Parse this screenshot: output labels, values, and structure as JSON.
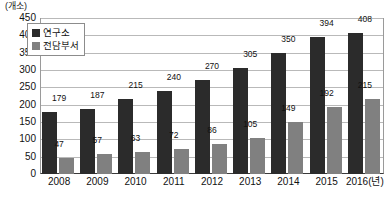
{
  "chart_data": {
    "type": "bar",
    "title": "",
    "subtitle": "",
    "unit_label": "(개소)",
    "xlabel": "",
    "ylabel": "",
    "ylim": [
      0,
      450
    ],
    "ytick_step": 50,
    "grid": true,
    "legend_position": "top-left",
    "categories": [
      "2008",
      "2009",
      "2010",
      "2011",
      "2012",
      "2013",
      "2014",
      "2015",
      "2016(년)"
    ],
    "series": [
      {
        "name": "연구소",
        "color": "#2b2b2b",
        "values": [
          179,
          187,
          215,
          240,
          270,
          305,
          350,
          394,
          408
        ]
      },
      {
        "name": "전담부서",
        "color": "#808080",
        "values": [
          47,
          57,
          63,
          72,
          86,
          105,
          149,
          192,
          215
        ]
      }
    ],
    "yticks": [
      "0",
      "50",
      "100",
      "150",
      "200",
      "250",
      "300",
      "350",
      "400",
      "450"
    ]
  }
}
